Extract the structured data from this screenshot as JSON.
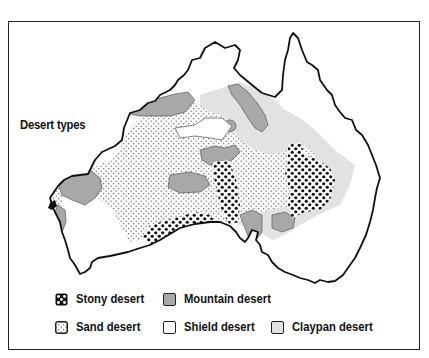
{
  "map": {
    "title": "Desert types",
    "region": "Australia",
    "colors": {
      "stony": "#111111",
      "mountain": "#a8a8a8",
      "sand_dot": "#555555",
      "shield": "#ffffff",
      "claypan": "#e2e2e2",
      "outline": "#111111"
    }
  },
  "legend": {
    "items": [
      {
        "key": "stony",
        "label": "Stony desert"
      },
      {
        "key": "mountain",
        "label": "Mountain desert"
      },
      {
        "key": "sand",
        "label": "Sand desert"
      },
      {
        "key": "shield",
        "label": "Shield desert"
      },
      {
        "key": "claypan",
        "label": "Claypan desert"
      }
    ]
  }
}
